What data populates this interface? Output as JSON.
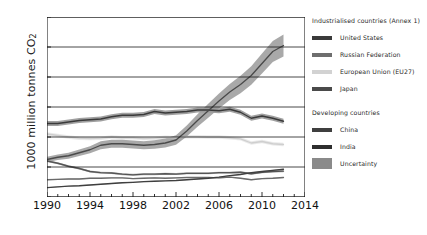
{
  "chart_data": {
    "type": "line",
    "title": "",
    "xlabel": "",
    "ylabel": "1000 million tonnes CO",
    "ylabel_sub": "2",
    "xlim": [
      1990,
      2014
    ],
    "ylim": [
      0,
      12
    ],
    "xticks": [
      1990,
      1994,
      1998,
      2002,
      2006,
      2010,
      2014
    ],
    "xticks_minor_step": 1,
    "yticks": [
      0,
      2,
      4,
      6,
      8,
      10,
      12
    ],
    "grid": "horizontal",
    "legend_position": "right-outside",
    "x": [
      1990,
      1991,
      1992,
      1993,
      1994,
      1995,
      1996,
      1997,
      1998,
      1999,
      2000,
      2001,
      2002,
      2003,
      2004,
      2005,
      2006,
      2007,
      2008,
      2009,
      2010,
      2011,
      2012
    ],
    "series": [
      {
        "name": "United States",
        "color": "#3a3a3a",
        "band_color": "#8f8f8f",
        "values": [
          4.9,
          4.9,
          5.0,
          5.1,
          5.15,
          5.2,
          5.35,
          5.45,
          5.45,
          5.5,
          5.7,
          5.6,
          5.65,
          5.7,
          5.8,
          5.8,
          5.75,
          5.85,
          5.65,
          5.25,
          5.4,
          5.25,
          5.05
        ],
        "uncertainty": [
          0.17,
          0.17,
          0.17,
          0.17,
          0.17,
          0.17,
          0.17,
          0.17,
          0.17,
          0.17,
          0.17,
          0.17,
          0.17,
          0.17,
          0.17,
          0.17,
          0.17,
          0.17,
          0.17,
          0.17,
          0.17,
          0.17,
          0.17
        ]
      },
      {
        "name": "Russian Federation",
        "color": "#555555",
        "band_color": "#a8a8a8",
        "values": [
          2.4,
          2.25,
          2.05,
          1.9,
          1.7,
          1.62,
          1.6,
          1.52,
          1.48,
          1.52,
          1.52,
          1.55,
          1.53,
          1.58,
          1.58,
          1.58,
          1.62,
          1.62,
          1.65,
          1.55,
          1.65,
          1.7,
          1.72
        ],
        "uncertainty": [
          0.07,
          0.07,
          0.07,
          0.07,
          0.07,
          0.07,
          0.07,
          0.07,
          0.07,
          0.07,
          0.07,
          0.07,
          0.07,
          0.07,
          0.07,
          0.07,
          0.07,
          0.07,
          0.07,
          0.07,
          0.07,
          0.07,
          0.07
        ]
      },
      {
        "name": "European Union (EU27)",
        "color": "#cfcfcf",
        "band_color": "#e6e6e6",
        "values": [
          4.2,
          4.1,
          4.0,
          3.92,
          3.9,
          3.92,
          4.0,
          3.95,
          3.95,
          3.9,
          3.92,
          3.98,
          3.95,
          4.02,
          4.02,
          4.0,
          4.0,
          3.95,
          3.88,
          3.6,
          3.7,
          3.55,
          3.5
        ],
        "uncertainty": [
          0.12,
          0.12,
          0.12,
          0.12,
          0.12,
          0.12,
          0.12,
          0.12,
          0.12,
          0.12,
          0.12,
          0.12,
          0.12,
          0.12,
          0.12,
          0.12,
          0.12,
          0.12,
          0.12,
          0.12,
          0.12,
          0.12,
          0.12
        ]
      },
      {
        "name": "Japan",
        "color": "#6a6a6a",
        "band_color": "#bdbdbd",
        "values": [
          1.15,
          1.18,
          1.2,
          1.2,
          1.25,
          1.25,
          1.27,
          1.27,
          1.22,
          1.25,
          1.27,
          1.25,
          1.28,
          1.3,
          1.3,
          1.3,
          1.28,
          1.32,
          1.25,
          1.15,
          1.22,
          1.25,
          1.3
        ],
        "uncertainty": [
          0.04,
          0.04,
          0.04,
          0.04,
          0.04,
          0.04,
          0.04,
          0.04,
          0.04,
          0.04,
          0.04,
          0.04,
          0.04,
          0.04,
          0.04,
          0.04,
          0.04,
          0.04,
          0.04,
          0.04,
          0.04,
          0.04,
          0.04
        ]
      },
      {
        "name": "China",
        "color": "#4a4a4a",
        "band_color": "#9a9a9a",
        "values": [
          2.5,
          2.65,
          2.75,
          2.95,
          3.15,
          3.45,
          3.55,
          3.55,
          3.5,
          3.45,
          3.5,
          3.6,
          3.8,
          4.4,
          5.1,
          5.75,
          6.4,
          7.0,
          7.5,
          8.1,
          8.9,
          9.7,
          10.1
        ],
        "uncertainty": [
          0.18,
          0.18,
          0.2,
          0.22,
          0.24,
          0.26,
          0.26,
          0.26,
          0.26,
          0.26,
          0.28,
          0.3,
          0.32,
          0.36,
          0.42,
          0.46,
          0.5,
          0.54,
          0.58,
          0.62,
          0.66,
          0.7,
          0.74
        ]
      },
      {
        "name": "India",
        "color": "#3f3f3f",
        "band_color": "#b5b5b5",
        "values": [
          0.62,
          0.68,
          0.72,
          0.75,
          0.8,
          0.85,
          0.9,
          0.95,
          0.98,
          1.02,
          1.05,
          1.08,
          1.1,
          1.15,
          1.2,
          1.25,
          1.32,
          1.42,
          1.5,
          1.62,
          1.7,
          1.78,
          1.85
        ],
        "uncertainty": [
          0.03,
          0.03,
          0.03,
          0.03,
          0.03,
          0.03,
          0.03,
          0.03,
          0.03,
          0.03,
          0.03,
          0.03,
          0.03,
          0.03,
          0.03,
          0.03,
          0.03,
          0.03,
          0.03,
          0.03,
          0.03,
          0.03,
          0.03
        ]
      }
    ]
  },
  "legend": {
    "group1_title": "Industrialised countries (Annex 1)",
    "group2_title": "Developing countries",
    "items_group1": [
      {
        "label": "United States",
        "color": "#3a3a3a"
      },
      {
        "label": "Russian Federation",
        "color": "#6e6e6e"
      },
      {
        "label": "European Union (EU27)",
        "color": "#d2d2d2"
      },
      {
        "label": "Japan",
        "color": "#4a4a4a"
      }
    ],
    "items_group2": [
      {
        "label": "China",
        "color": "#3f3f3f"
      },
      {
        "label": "India",
        "color": "#2e2e2e"
      },
      {
        "label": "Uncertainty",
        "color": "#8a8a8a",
        "shape": "box"
      }
    ]
  },
  "axis": {
    "y_label_main": "1000 million tonnes CO",
    "y_label_sub": "2"
  }
}
